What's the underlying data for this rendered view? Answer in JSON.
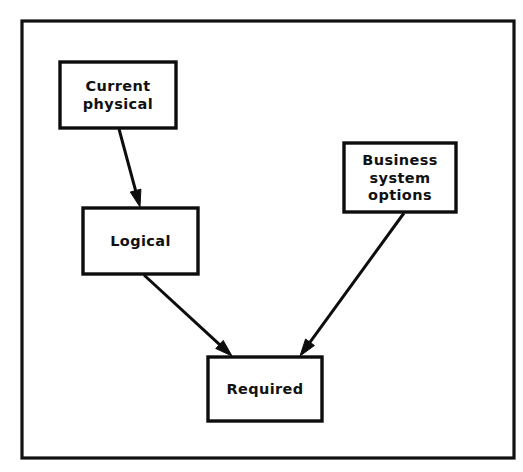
{
  "diagram": {
    "background_color": "#ffffff",
    "stroke_color": "#0d0d0d",
    "frame": {
      "name": "outer-border",
      "x": 22,
      "y": 21,
      "width": 492,
      "height": 437
    },
    "nodes": [
      {
        "id": "current-physical",
        "label_lines": [
          "Current",
          "physical"
        ],
        "label": "Current physical",
        "x": 60,
        "y": 62,
        "width": 116,
        "height": 66
      },
      {
        "id": "logical",
        "label_lines": [
          "Logical"
        ],
        "label": "Logical",
        "x": 83,
        "y": 208,
        "width": 115,
        "height": 66
      },
      {
        "id": "business-system-options",
        "label_lines": [
          "Business",
          "system",
          "options"
        ],
        "label": "Business system options",
        "x": 344,
        "y": 143,
        "width": 112,
        "height": 69
      },
      {
        "id": "required",
        "label_lines": [
          "Required"
        ],
        "label": "Required",
        "x": 208,
        "y": 357,
        "width": 114,
        "height": 64
      }
    ],
    "edges": [
      {
        "id": "current-physical-to-logical",
        "from": "current-physical",
        "to": "logical",
        "x1": 119,
        "y1": 129,
        "x2": 140,
        "y2": 207,
        "arrow": "end"
      },
      {
        "id": "logical-to-required",
        "from": "logical",
        "to": "required",
        "x1": 144,
        "y1": 275,
        "x2": 232,
        "y2": 356,
        "arrow": "end"
      },
      {
        "id": "business-system-options-to-required",
        "from": "business-system-options",
        "to": "required",
        "x1": 404,
        "y1": 213,
        "x2": 300,
        "y2": 356,
        "arrow": "end"
      }
    ]
  }
}
